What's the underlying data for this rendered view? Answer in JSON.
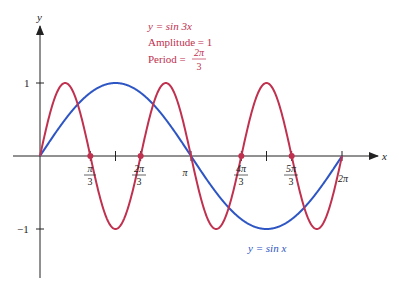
{
  "chart_data": {
    "type": "line",
    "title": "",
    "xlabel": "x",
    "ylabel": "y",
    "xlim": [
      0,
      6.2832
    ],
    "ylim": [
      -1,
      1
    ],
    "grid": false,
    "x_ticks": [
      {
        "value": 1.0472,
        "num": "π",
        "den": "3"
      },
      {
        "value": 2.0944,
        "num": "2π",
        "den": "3"
      },
      {
        "value": 3.1416,
        "label": "π"
      },
      {
        "value": 4.1888,
        "num": "4π",
        "den": "3"
      },
      {
        "value": 5.236,
        "num": "5π",
        "den": "3"
      },
      {
        "value": 6.2832,
        "label": "2π"
      }
    ],
    "x_ticks_unlabeled": [
      1.5708,
      4.7124
    ],
    "y_ticks": [
      {
        "value": 1,
        "label": "1"
      },
      {
        "value": -1,
        "label": "−1"
      }
    ],
    "series": [
      {
        "name": "y = sin 3x",
        "color": "#c0304f",
        "function": "sin(3x)",
        "amplitude": 1,
        "period": "2π/3",
        "zeros_marked": [
          1.0472,
          2.0944,
          4.1888,
          5.236
        ]
      },
      {
        "name": "y = sin x",
        "color": "#2d55c4",
        "function": "sin(x)",
        "amplitude": 1,
        "period": "2π"
      }
    ],
    "annotations": [
      {
        "text_lines": [
          "y = sin 3x",
          "Amplitude = 1",
          "Period = 2π/3"
        ],
        "color": "#c0304f"
      },
      {
        "text": "y = sin x",
        "color": "#2d55c4"
      }
    ]
  },
  "labels": {
    "y_axis": "y",
    "x_axis": "x",
    "y_tick_pos": "1",
    "y_tick_neg": "−1",
    "red_eq": "y = sin 3x",
    "red_amp": "Amplitude = 1",
    "red_period_prefix": "Period = ",
    "red_period_num": "2π",
    "red_period_den": "3",
    "blue_eq": "y = sin x",
    "tick_pi_3_num": "π",
    "tick_pi_3_den": "3",
    "tick_2pi_3_num": "2π",
    "tick_2pi_3_den": "3",
    "tick_pi": "π",
    "tick_4pi_3_num": "4π",
    "tick_4pi_3_den": "3",
    "tick_5pi_3_num": "5π",
    "tick_5pi_3_den": "3",
    "tick_2pi": "2π"
  },
  "colors": {
    "red": "#c0304f",
    "blue": "#2d55c4",
    "axis": "#222222"
  }
}
